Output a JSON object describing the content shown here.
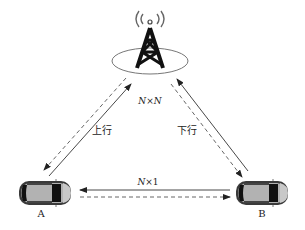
{
  "diagram": {
    "type": "V2X communication topology",
    "nodes": {
      "tower": {
        "icon": "cell-tower-icon"
      },
      "vehicle_a": {
        "label": "A",
        "icon": "car-icon"
      },
      "vehicle_b": {
        "label": "B",
        "icon": "car-icon"
      }
    },
    "links": {
      "uplink": {
        "label": "上行",
        "from": "A",
        "to": "tower"
      },
      "downlink": {
        "label": "下行",
        "from": "tower",
        "to": "B"
      },
      "sidelink": {
        "label": "N×1",
        "between": [
          "A",
          "B"
        ]
      },
      "cellular": {
        "label": "N×N"
      }
    },
    "labels": {
      "nxn_n1": "N",
      "nxn_x": "×",
      "nxn_n2": "N",
      "nx1_n": "N",
      "nx1_rest": "×1",
      "uplink": "上行",
      "downlink": "下行",
      "a": "A",
      "b": "B"
    },
    "colors": {
      "line": "#333333",
      "dashed": "#555555",
      "car_body": "#a8a8a8",
      "car_dark": "#111111",
      "tower": "#111111",
      "ellipse": "#777777"
    }
  }
}
